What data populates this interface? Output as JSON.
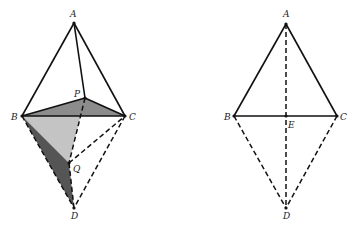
{
  "figures": [
    {
      "name": "left-figure",
      "points": {
        "A": {
          "label": "A",
          "x": 74,
          "y": 23
        },
        "P": {
          "label": "P",
          "x": 85,
          "y": 98
        },
        "B": {
          "label": "B",
          "x": 22,
          "y": 116
        },
        "C": {
          "label": "C",
          "x": 125,
          "y": 116
        },
        "Q": {
          "label": "Q",
          "x": 69,
          "y": 163
        },
        "D": {
          "label": "D",
          "x": 74,
          "y": 208
        }
      },
      "solid_edges": [
        "AB",
        "AC",
        "AP",
        "BC",
        "BP",
        "PC"
      ],
      "dashed_edges": [
        "PQ",
        "QD",
        "BD",
        "QC",
        "CD"
      ],
      "shaded_faces": [
        {
          "vertices": [
            "B",
            "P",
            "C"
          ],
          "color": "#8c8c8c"
        },
        {
          "vertices": [
            "B",
            "P",
            "Q"
          ],
          "color": "#c4c4c4"
        },
        {
          "vertices": [
            "B",
            "Q",
            "D"
          ],
          "color": "#555555"
        }
      ]
    },
    {
      "name": "right-figure",
      "points": {
        "A": {
          "label": "A",
          "x": 286,
          "y": 24
        },
        "B": {
          "label": "B",
          "x": 234,
          "y": 116
        },
        "E": {
          "label": "E",
          "x": 286,
          "y": 116
        },
        "C": {
          "label": "C",
          "x": 337,
          "y": 116
        },
        "D": {
          "label": "D",
          "x": 286,
          "y": 208
        }
      },
      "solid_edges": [
        "AB",
        "AC",
        "BC"
      ],
      "dashed_edges": [
        "AD",
        "BD",
        "CD"
      ]
    }
  ],
  "colors": {
    "line": "#111111",
    "light_face": "#c4c4c4",
    "mid_face": "#8c8c8c",
    "dark_face": "#555555"
  }
}
